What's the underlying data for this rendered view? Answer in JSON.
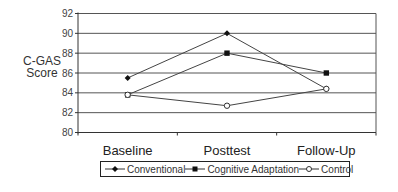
{
  "chart_data": {
    "type": "line",
    "title": "",
    "xlabel": "",
    "ylabel": "C-GAS Score",
    "ylabel_lines": [
      "C-GAS",
      "Score"
    ],
    "categories": [
      "Baseline",
      "Posttest",
      "Follow-Up"
    ],
    "ylim": [
      80,
      92
    ],
    "yticks": [
      80,
      82,
      84,
      86,
      88,
      90,
      92
    ],
    "grid": true,
    "legend_position": "bottom",
    "series": [
      {
        "name": "Conventional",
        "marker": "filled-diamond",
        "values": [
          85.5,
          90.0,
          84.4
        ]
      },
      {
        "name": "Cognitive Adaptation",
        "marker": "filled-square",
        "values": [
          83.8,
          88.0,
          86.0
        ]
      },
      {
        "name": "Control",
        "marker": "open-circle",
        "values": [
          83.8,
          82.7,
          84.4
        ]
      }
    ]
  },
  "colors": {
    "line": "#444444",
    "grid": "#555555",
    "axis": "#333333"
  }
}
